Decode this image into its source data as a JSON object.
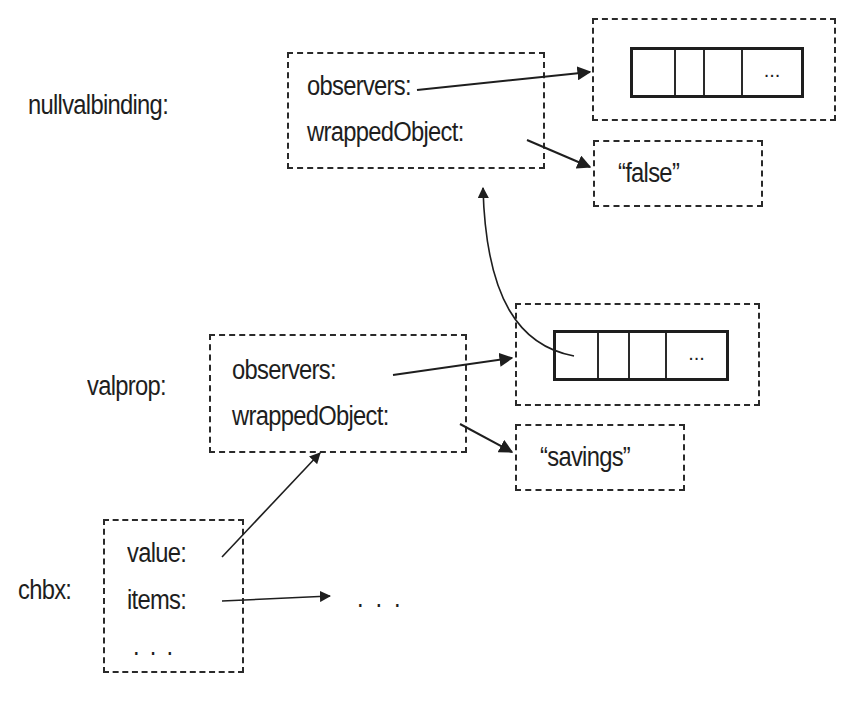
{
  "diagram": {
    "nullvalbinding": {
      "label": "nullvalbinding:",
      "fields": [
        "observers:",
        "wrappedObject:"
      ],
      "observers_array": {
        "cells": [
          "",
          "",
          "",
          "..."
        ]
      },
      "wrapped_value": "“false”"
    },
    "valprop": {
      "label": "valprop:",
      "fields": [
        "observers:",
        "wrappedObject:"
      ],
      "observers_array": {
        "cells": [
          "",
          "",
          "",
          "..."
        ]
      },
      "wrapped_value": "“savings”"
    },
    "chbx": {
      "label": "chbx:",
      "fields": [
        "value:",
        "items:",
        ". . ."
      ],
      "items_target": ". . ."
    },
    "colors": {
      "ink": "#1e1e1e",
      "background": "#ffffff"
    }
  }
}
